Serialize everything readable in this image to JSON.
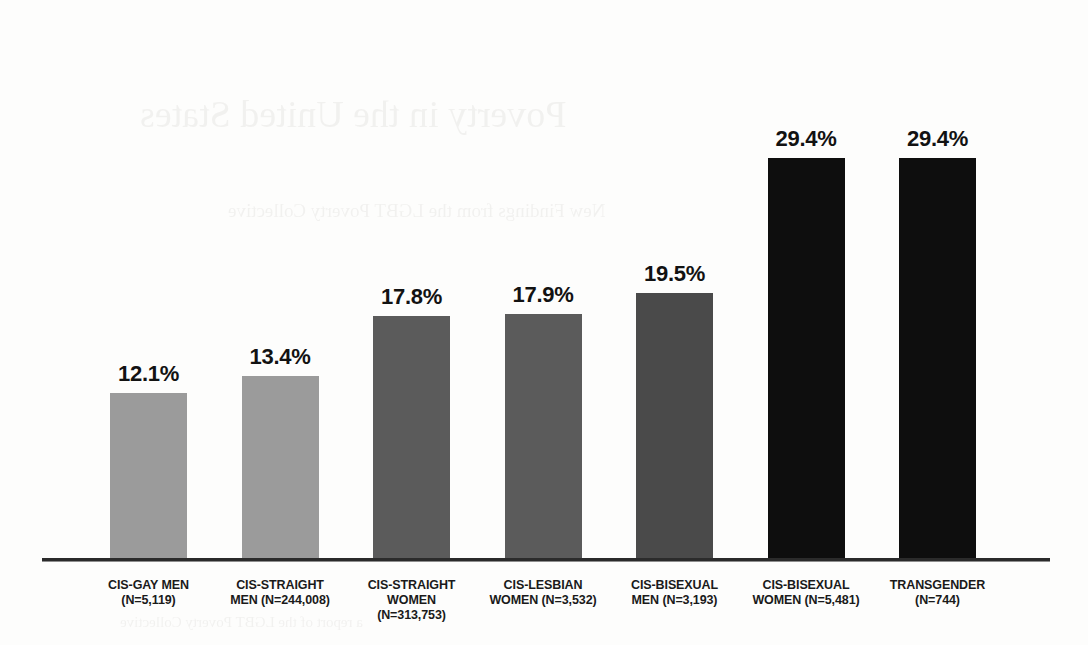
{
  "chart_data": {
    "type": "bar",
    "title": "",
    "subtitle": "",
    "xlabel": "",
    "ylabel": "",
    "ylim": [
      0,
      36
    ],
    "grid": false,
    "legend": "none",
    "value_label_suffix": "%",
    "categories": [
      "CIS-GAY MEN (N=5,119)",
      "CIS-STRAIGHT MEN (N=244,008)",
      "CIS-STRAIGHT WOMEN (N=313,753)",
      "CIS-LESBIAN WOMEN (N=3,532)",
      "CIS-BISEXUAL MEN (N=3,193)",
      "CIS-BISEXUAL WOMEN (N=5,481)",
      "TRANSGENDER (N=744)"
    ],
    "values": [
      12.1,
      13.4,
      17.8,
      17.9,
      19.5,
      29.4,
      29.4
    ],
    "bars": [
      {
        "group": "cis-gay-men",
        "line1": "CIS-GAY MEN",
        "line2": "(N=5,119)",
        "line3": "",
        "n": "5,119",
        "value": 12.1,
        "value_label": "12.1%",
        "color": "#9b9b9b"
      },
      {
        "group": "cis-straight-men",
        "line1": "CIS-STRAIGHT",
        "line2": "MEN (N=244,008)",
        "line3": "",
        "n": "244,008",
        "value": 13.4,
        "value_label": "13.4%",
        "color": "#9b9b9b"
      },
      {
        "group": "cis-straight-women",
        "line1": "CIS-STRAIGHT",
        "line2": "WOMEN",
        "line3": "(N=313,753)",
        "n": "313,753",
        "value": 17.8,
        "value_label": "17.8%",
        "color": "#5b5b5b"
      },
      {
        "group": "cis-lesbian-women",
        "line1": "CIS-LESBIAN",
        "line2": "WOMEN (N=3,532)",
        "line3": "",
        "n": "3,532",
        "value": 17.9,
        "value_label": "17.9%",
        "color": "#5b5b5b"
      },
      {
        "group": "cis-bisexual-men",
        "line1": "CIS-BISEXUAL",
        "line2": "MEN (N=3,193)",
        "line3": "",
        "n": "3,193",
        "value": 19.5,
        "value_label": "19.5%",
        "color": "#4a4a4a"
      },
      {
        "group": "cis-bisexual-women",
        "line1": "CIS-BISEXUAL",
        "line2": "WOMEN (N=5,481)",
        "line3": "",
        "n": "5,481",
        "value": 29.4,
        "value_label": "29.4%",
        "color": "#0e0e0e"
      },
      {
        "group": "transgender",
        "line1": "TRANSGENDER",
        "line2": "(N=744)",
        "line3": "",
        "n": "744",
        "value": 29.4,
        "value_label": "29.4%",
        "color": "#0e0e0e"
      }
    ]
  },
  "page_bleed": {
    "title": "Poverty in the United States",
    "subtitle": "New Findings from the LGBT Poverty Collective",
    "footer": "a report of the LGBT Poverty Collective"
  },
  "colors": {
    "light_gray": "#9b9b9b",
    "mid_gray": "#5b5b5b",
    "dark_gray": "#4a4a4a",
    "near_black": "#0e0e0e",
    "axis": "#2b2b2b",
    "background": "#fdfdfc"
  }
}
